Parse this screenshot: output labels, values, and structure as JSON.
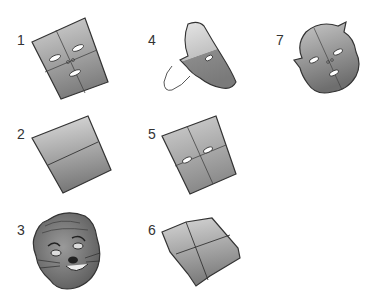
{
  "diagram": {
    "type": "step-illustration",
    "steps": [
      {
        "number": "1",
        "label": "1",
        "description": "folded paper with eyes, nose and mouth cut"
      },
      {
        "number": "2",
        "label": "2",
        "description": "paper folded in half"
      },
      {
        "number": "3",
        "label": "3",
        "description": "finished decorated animal mask"
      },
      {
        "number": "4",
        "label": "4",
        "description": "folded paper with half-face outline being cut"
      },
      {
        "number": "5",
        "label": "5",
        "description": "unfolded paper with eye slits"
      },
      {
        "number": "6",
        "label": "6",
        "description": "paper folded into quarters"
      },
      {
        "number": "7",
        "label": "7",
        "description": "unfolded cut-out face shape"
      }
    ]
  },
  "colors": {
    "paper_light": "#c8c8c8",
    "paper_dark": "#8a8a8a",
    "outline": "#333333",
    "background": "#ffffff"
  }
}
